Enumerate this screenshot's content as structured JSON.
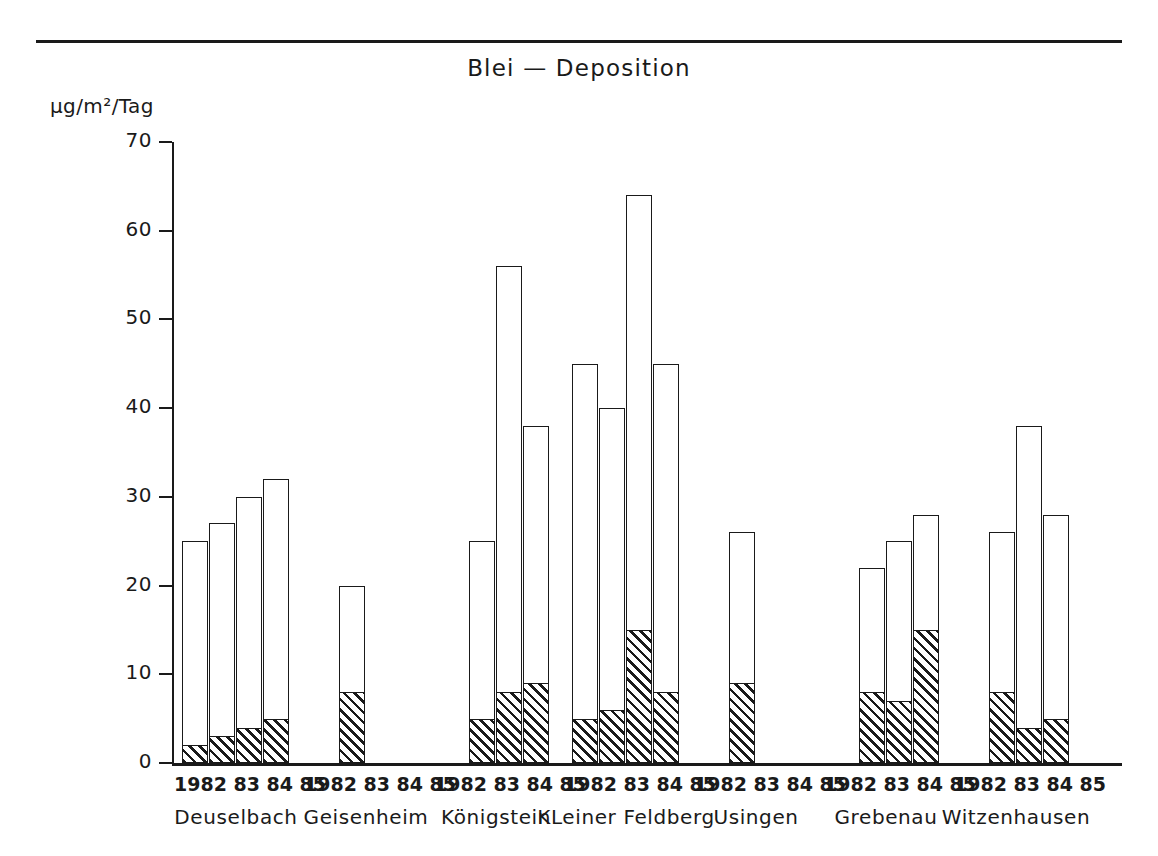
{
  "chart_data": {
    "type": "bar",
    "title": "Blei — Deposition",
    "subtitle": "",
    "ylabel": "µg/m²/Tag",
    "xlabel": "",
    "ylim": [
      0,
      70
    ],
    "yticks": [
      0,
      10,
      20,
      30,
      40,
      50,
      60,
      70
    ],
    "ytick_labels": [
      "0",
      "10",
      "20",
      "30",
      "40",
      "50",
      "60",
      "70"
    ],
    "grid": false,
    "legend": "none",
    "stacked": true,
    "categories": [
      "1982",
      "83",
      "84",
      "85"
    ],
    "series": [
      {
        "name": "hatched-lower",
        "pattern": "diagonal-hatch"
      },
      {
        "name": "white-upper",
        "pattern": "solid-white"
      }
    ],
    "groups": [
      {
        "station": "Deuselbach",
        "years": [
          "1982",
          "83",
          "84",
          "85"
        ],
        "bars": [
          {
            "year": "1982",
            "total": 25,
            "hatched": 2
          },
          {
            "year": "83",
            "total": 27,
            "hatched": 3
          },
          {
            "year": "84",
            "total": 30,
            "hatched": 4
          },
          {
            "year": "85",
            "total": 32,
            "hatched": 5
          }
        ]
      },
      {
        "station": "Geisenheim",
        "years": [
          "1982",
          "83",
          "84",
          "85"
        ],
        "bars": [
          {
            "year": "83",
            "total": 20,
            "hatched": 8
          }
        ]
      },
      {
        "station": "Königstein",
        "years": [
          "1982",
          "83",
          "84",
          "85"
        ],
        "bars": [
          {
            "year": "83",
            "total": 25,
            "hatched": 5
          },
          {
            "year": "84",
            "total": 56,
            "hatched": 8
          },
          {
            "year": "85",
            "total": 38,
            "hatched": 9
          }
        ]
      },
      {
        "station": "KLeiner Feldberg",
        "years": [
          "1982",
          "83",
          "84",
          "85"
        ],
        "bars": [
          {
            "year": "1982",
            "total": 45,
            "hatched": 5
          },
          {
            "year": "83",
            "total": 40,
            "hatched": 6
          },
          {
            "year": "84",
            "total": 64,
            "hatched": 15
          },
          {
            "year": "85",
            "total": 45,
            "hatched": 8
          }
        ]
      },
      {
        "station": "Usingen",
        "years": [
          "1982",
          "83",
          "84",
          "85"
        ],
        "bars": [
          {
            "year": "83",
            "total": 26,
            "hatched": 9
          }
        ]
      },
      {
        "station": "Grebenau",
        "years": [
          "1982",
          "83",
          "84",
          "85"
        ],
        "bars": [
          {
            "year": "83",
            "total": 22,
            "hatched": 8
          },
          {
            "year": "84",
            "total": 25,
            "hatched": 7
          },
          {
            "year": "85",
            "total": 28,
            "hatched": 15
          }
        ]
      },
      {
        "station": "Witzenhausen",
        "years": [
          "1982",
          "83",
          "84",
          "85"
        ],
        "bars": [
          {
            "year": "83",
            "total": 26,
            "hatched": 8
          },
          {
            "year": "84",
            "total": 38,
            "hatched": 4
          },
          {
            "year": "85",
            "total": 28,
            "hatched": 5
          }
        ]
      }
    ]
  },
  "axis": {
    "year_row_text": "1982 83 84 85"
  },
  "colors": {
    "ink": "#1a1a1a",
    "paper": "#ffffff",
    "hatch": "#1a1a1a"
  }
}
